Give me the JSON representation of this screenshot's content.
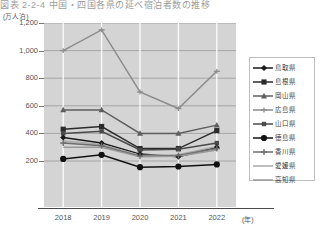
{
  "title": "図表 2-2-4 中国・四国各県の延べ宿泊者数の推移",
  "axis": {
    "y_unit": "(万人泊)",
    "x_unit": "(年)",
    "y_ticks": [
      "1,200",
      "1,000",
      "800",
      "600",
      "400",
      "200"
    ],
    "x_ticks": [
      "2018",
      "2019",
      "2020",
      "2021",
      "2022"
    ]
  },
  "legend": {
    "items": [
      {
        "label": "鳥取県",
        "marker": "diamond-marker",
        "color": "#1a1a1a"
      },
      {
        "label": "島根県",
        "marker": "square-marker",
        "color": "#2b2b2b"
      },
      {
        "label": "岡山県",
        "marker": "triangle-marker",
        "color": "#5e5e5e"
      },
      {
        "label": "広島県",
        "marker": "dash-marker",
        "color": "#8d8d8d"
      },
      {
        "label": "山口県",
        "marker": "square-small-marker",
        "color": "#4a4a4a"
      },
      {
        "label": "徳島県",
        "marker": "circle-marker",
        "color": "#111111"
      },
      {
        "label": "香川県",
        "marker": "plus-marker",
        "color": "#6d6d6d"
      },
      {
        "label": "愛媛県",
        "marker": "line-marker",
        "color": "#a8a8a8"
      },
      {
        "label": "高知県",
        "marker": "line-marker",
        "color": "#9a9a9a"
      }
    ]
  },
  "chart_data": {
    "type": "line",
    "title": "図表 2-2-4 中国・四国各県の延べ宿泊者数の推移",
    "xlabel": "(年)",
    "ylabel": "(万人泊)",
    "categories": [
      "2018",
      "2019",
      "2020",
      "2021",
      "2022"
    ],
    "ylim": [
      100,
      1200
    ],
    "grid": true,
    "legend_position": "right",
    "series": [
      {
        "name": "広島県",
        "values": [
          1000,
          1150,
          700,
          580,
          850
        ],
        "color": "#8d8d8d",
        "marker": "dash-marker"
      },
      {
        "name": "岡山県",
        "values": [
          570,
          570,
          400,
          400,
          460
        ],
        "color": "#5e5e5e",
        "marker": "triangle-marker"
      },
      {
        "name": "島根県",
        "values": [
          430,
          450,
          290,
          290,
          420
        ],
        "color": "#2b2b2b",
        "marker": "square-marker"
      },
      {
        "name": "山口県",
        "values": [
          400,
          415,
          280,
          285,
          330
        ],
        "color": "#4a4a4a",
        "marker": "square-small-marker"
      },
      {
        "name": "鳥取県",
        "values": [
          370,
          330,
          250,
          230,
          300
        ],
        "color": "#1a1a1a",
        "marker": "diamond-marker"
      },
      {
        "name": "愛媛県",
        "values": [
          345,
          320,
          240,
          245,
          305
        ],
        "color": "#a8a8a8",
        "marker": "line-marker"
      },
      {
        "name": "香川県",
        "values": [
          330,
          310,
          235,
          240,
          290
        ],
        "color": "#6d6d6d",
        "marker": "plus-marker"
      },
      {
        "name": "高知県",
        "values": [
          300,
          300,
          230,
          235,
          280
        ],
        "color": "#9a9a9a",
        "marker": "line-marker"
      },
      {
        "name": "徳島県",
        "values": [
          215,
          245,
          155,
          160,
          175
        ],
        "color": "#111111",
        "marker": "circle-marker"
      }
    ]
  }
}
